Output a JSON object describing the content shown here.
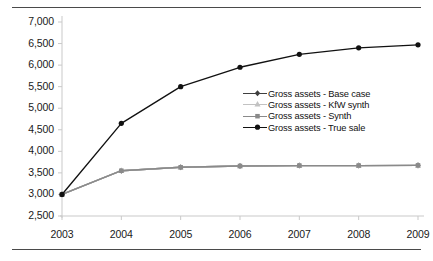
{
  "chart_data": {
    "type": "line",
    "title": "",
    "subtitle": "",
    "xlabel": "",
    "ylabel": "",
    "categories": [
      "2003",
      "2004",
      "2005",
      "2006",
      "2007",
      "2008",
      "2009"
    ],
    "x": [
      2003,
      2004,
      2005,
      2006,
      2007,
      2008,
      2009
    ],
    "ylim": [
      2500,
      7000
    ],
    "yticks": [
      2500,
      3000,
      3500,
      4000,
      4500,
      5000,
      5500,
      6000,
      6500,
      7000
    ],
    "ytick_labels": [
      "2,500",
      "3,000",
      "3,500",
      "4,000",
      "4,500",
      "5,000",
      "5,500",
      "6,000",
      "6,500",
      "7,000"
    ],
    "xtick_labels": [
      "2003",
      "2004",
      "2005",
      "2006",
      "2007",
      "2008",
      "2009"
    ],
    "grid": false,
    "legend_position": "center-right",
    "series": [
      {
        "name": "Gross assets - Base case",
        "marker": "diamond",
        "color": "#3f3f3f",
        "values": [
          3000,
          3550,
          3630,
          3660,
          3670,
          3670,
          3675
        ]
      },
      {
        "name": "Gross assets - KfW synth",
        "marker": "triangle",
        "color": "#c2c2c2",
        "values": [
          3000,
          3550,
          3630,
          3660,
          3670,
          3670,
          3675
        ]
      },
      {
        "name": "Gross assets - Synth",
        "marker": "square",
        "color": "#8a8a8a",
        "values": [
          3000,
          3550,
          3630,
          3660,
          3670,
          3670,
          3675
        ]
      },
      {
        "name": "Gross assets - True sale",
        "marker": "circle",
        "color": "#111111",
        "values": [
          3000,
          4650,
          5500,
          5950,
          6250,
          6400,
          6470
        ]
      }
    ]
  },
  "legend": {
    "items": [
      {
        "label": "Gross assets - Base case"
      },
      {
        "label": "Gross assets - KfW synth"
      },
      {
        "label": "Gross assets - Synth"
      },
      {
        "label": "Gross assets - True sale"
      }
    ]
  },
  "axis": {
    "y_labels": [
      "7,000",
      "6,500",
      "6,000",
      "5,500",
      "5,000",
      "4,500",
      "4,000",
      "3,500",
      "3,000",
      "2,500"
    ],
    "x_labels": [
      "2003",
      "2004",
      "2005",
      "2006",
      "2007",
      "2008",
      "2009"
    ]
  }
}
